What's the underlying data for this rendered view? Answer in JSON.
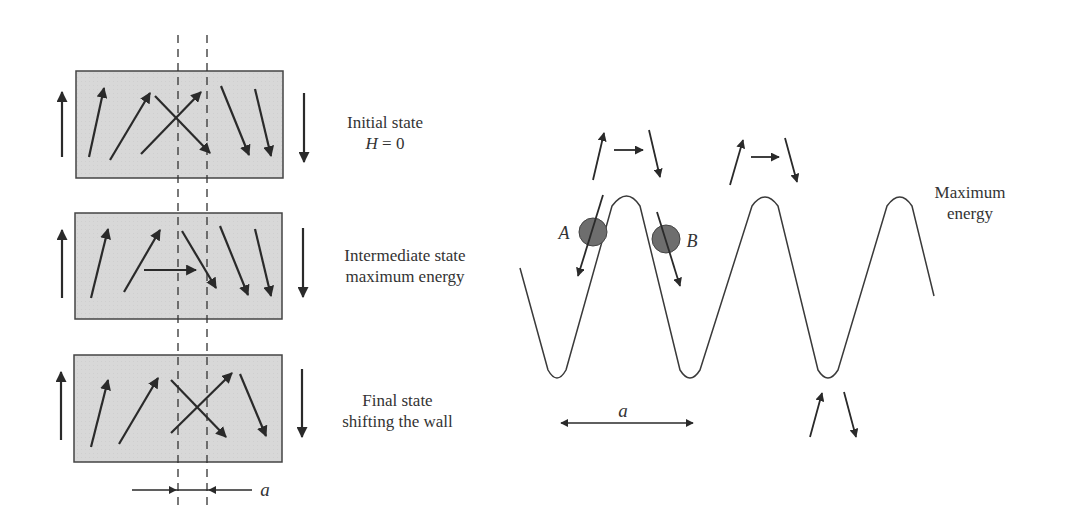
{
  "left_panel": {
    "states": [
      {
        "line1": "Initial state",
        "line2_var": "H",
        "line2_rest": " = 0"
      },
      {
        "line1": "Intermediate state",
        "line2": "maximum energy"
      },
      {
        "line1": "Final state",
        "line2": "shifting the wall"
      }
    ],
    "width_label": "a"
  },
  "right_panel": {
    "label_max_line1": "Maximum",
    "label_max_line2": "energy",
    "point_a": "A",
    "point_b": "B",
    "period_label": "a"
  },
  "colors": {
    "box_fill": "#d9d9d9",
    "stroke": "#2a2a2a",
    "ball_fill": "#6e6e6e"
  }
}
